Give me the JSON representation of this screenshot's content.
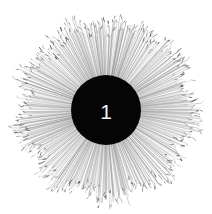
{
  "figure": {
    "name": "radial-dendrogram",
    "background_color": "#ffffff",
    "width": 212,
    "height": 214,
    "hub": {
      "label": "1",
      "label_color": "#f2f2f2",
      "disc_color": "#050505",
      "center_x": 106,
      "center_y": 110,
      "radius": 35
    }
  },
  "chart_data": {
    "type": "radial-dendrogram",
    "title": "",
    "subtitle": "",
    "xlabel": "",
    "ylabel": "",
    "legend": [],
    "annotations": [],
    "grid": false,
    "root_label": "1",
    "center": [
      106,
      110
    ],
    "inner_radius": 35,
    "outer_radius_min": 62,
    "outer_radius_max": 96,
    "leaf_count": 560,
    "angular_range_deg": [
      0,
      360
    ],
    "stroke_color": "#8c8c8c",
    "tip_color": "#3a3a3a",
    "series": [
      {
        "name": "leaf-branches",
        "description": "thin radial branch lines radiating from the central hub, each ending in a small tick mark representing a tip label",
        "count": 560
      }
    ],
    "density_profile": {
      "description": "branch density highest adjacent to the hub, fading outward; clustered sectors form darker wedges",
      "inner_opacity": 0.85,
      "outer_opacity": 0.32
    }
  }
}
